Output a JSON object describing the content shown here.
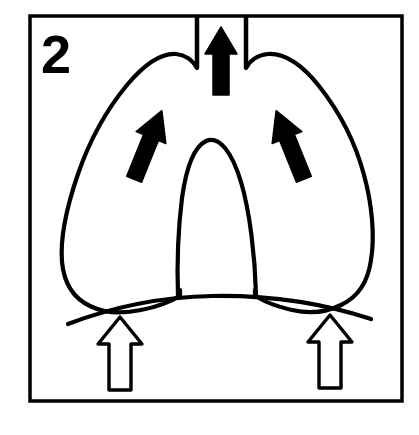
{
  "figure": {
    "panel_number": "2",
    "caption": "",
    "frame": {
      "stroke_color": "#000000",
      "fill_color": "#ffffff",
      "x": 30,
      "y": 16,
      "width": 372,
      "height": 385,
      "stroke_width": 3.5
    },
    "colors": {
      "ink": "#000000",
      "paper": "#ffffff",
      "solid_arrow_fill": "#000000",
      "hollow_arrow_fill": "#ffffff",
      "hollow_arrow_stroke": "#000000"
    },
    "parts": [
      {
        "id": "trachea",
        "label": "trachea",
        "kind": "outline",
        "stroke_width": 4
      },
      {
        "id": "left-lung",
        "label": "left lung",
        "kind": "outline",
        "stroke_width": 4
      },
      {
        "id": "right-lung",
        "label": "right lung",
        "kind": "outline",
        "stroke_width": 4
      },
      {
        "id": "mediastinum",
        "label": "mediastinum / heart",
        "kind": "outline",
        "stroke_width": 4
      },
      {
        "id": "diaphragm",
        "label": "diaphragm",
        "kind": "curve",
        "stroke_width": 4
      }
    ],
    "arrows": [
      {
        "id": "trachea-airflow-arrow",
        "label": "airflow up trachea",
        "style": "solid",
        "direction": "up",
        "angle_deg": 0
      },
      {
        "id": "left-lung-expansion-arrow",
        "label": "left lung expansion",
        "style": "solid",
        "direction": "up-right",
        "angle_deg": 22
      },
      {
        "id": "right-lung-expansion-arrow",
        "label": "right lung expansion",
        "style": "solid",
        "direction": "up-left",
        "angle_deg": -22
      },
      {
        "id": "diaphragm-left-arrow",
        "label": "diaphragm ascent left",
        "style": "hollow",
        "direction": "up",
        "angle_deg": 0
      },
      {
        "id": "diaphragm-right-arrow",
        "label": "diaphragm ascent right",
        "style": "hollow",
        "direction": "up",
        "angle_deg": 0
      }
    ]
  }
}
